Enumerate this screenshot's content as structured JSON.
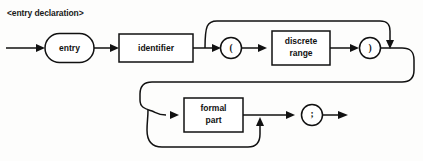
{
  "diagram": {
    "title": "<entry declaration>",
    "type": "railroad-syntax-diagram",
    "colors": {
      "background": "#fdfdfc",
      "line": "#111111",
      "node_fill": "#ffffff",
      "text": "#111111"
    },
    "rows": [
      {
        "id": "row-1",
        "nodes": [
          {
            "id": "entry-keyword",
            "shape": "stadium",
            "label": "entry"
          },
          {
            "id": "identifier",
            "shape": "rect",
            "label": "identifier"
          },
          {
            "id": "open-paren",
            "shape": "circle",
            "label": "("
          },
          {
            "id": "discrete-range",
            "shape": "rect",
            "label": "discrete range",
            "line1": "discrete",
            "line2": "range"
          },
          {
            "id": "close-paren",
            "shape": "circle",
            "label": ")"
          }
        ]
      },
      {
        "id": "row-2",
        "nodes": [
          {
            "id": "formal-part",
            "shape": "rect",
            "label": "formal part",
            "line1": "formal",
            "line2": "part"
          },
          {
            "id": "semicolon",
            "shape": "circle",
            "label": ";"
          }
        ]
      }
    ],
    "bypass_paths": [
      {
        "id": "bypass-paren-group",
        "skips": [
          "open-paren",
          "discrete-range",
          "close-paren"
        ]
      },
      {
        "id": "bypass-formal-part",
        "skips": [
          "formal-part"
        ]
      }
    ]
  }
}
